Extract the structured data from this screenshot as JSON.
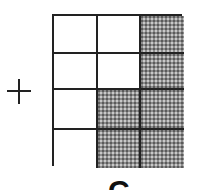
{
  "colors": {
    "line": "#222222",
    "shade": "#8c8c8c",
    "background": "#ffffff"
  },
  "operator": {
    "symbol": "+",
    "icon": "plus-icon"
  },
  "grid": {
    "rows": 4,
    "cols": 3,
    "shaded": [
      [
        false,
        false,
        true
      ],
      [
        false,
        false,
        true
      ],
      [
        false,
        true,
        true
      ],
      [
        false,
        true,
        true
      ]
    ],
    "shaded_count": 6,
    "total_cells": 12
  },
  "bottom_label": {
    "text": "C",
    "note": "partially visible, cut off at bottom edge"
  }
}
